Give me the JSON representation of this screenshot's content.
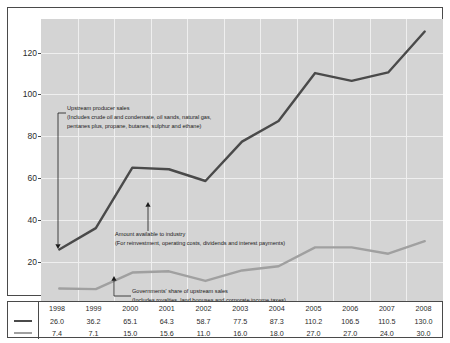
{
  "chart_data": {
    "type": "line",
    "title": "",
    "xlabel": "",
    "ylabel": "",
    "ylim": [
      0,
      136
    ],
    "yticks": [
      20,
      40,
      60,
      80,
      100,
      120
    ],
    "grid": true,
    "legend_position": "table-left",
    "categories": [
      "1998",
      "1999",
      "2000",
      "2001",
      "2002",
      "2003",
      "2004",
      "2005",
      "2006",
      "2007",
      "2008"
    ],
    "series": [
      {
        "name": "Upstream producer sales",
        "color": "#4a4a4a",
        "values": [
          26.0,
          36.2,
          65.1,
          64.3,
          58.7,
          77.5,
          87.3,
          110.2,
          106.5,
          110.5,
          130.0
        ]
      },
      {
        "name": "Governments' share of upstream sales",
        "color": "#a0a0a0",
        "values": [
          7.4,
          7.1,
          15.0,
          15.6,
          11.0,
          16.0,
          18.0,
          27.0,
          27.0,
          24.0,
          30.0
        ]
      }
    ],
    "annotations": [
      {
        "id": "upstream-producer-sales",
        "line1": "Upstream producer sales",
        "line2": "(Includes crude oil and condensate, oil sands, natural gas,",
        "line3": "pentanes plus, propane, butanes, sulphur and ethane)"
      },
      {
        "id": "amount-available-to-industry",
        "line1": "Amount available to industry",
        "line2": "(For reinvestment, operating costs, dividends and interest payments)",
        "line3": ""
      },
      {
        "id": "governments-share",
        "line1": "Governments' share of upstream sales",
        "line2": "(Includes royalties, land bonuses and corporate income taxes)",
        "line3": ""
      }
    ]
  },
  "table": {
    "headers": [
      "1998",
      "1999",
      "2000",
      "2001",
      "2002",
      "2003",
      "2004",
      "2005",
      "2006",
      "2007",
      "2008"
    ],
    "rows": [
      {
        "swatch": "dark-line-swatch",
        "values": [
          "26.0",
          "36.2",
          "65.1",
          "64.3",
          "58.7",
          "77.5",
          "87.3",
          "110.2",
          "106.5",
          "110.5",
          "130.0"
        ]
      },
      {
        "swatch": "light-line-swatch",
        "values": [
          "7.4",
          "7.1",
          "15.0",
          "15.6",
          "11.0",
          "16.0",
          "18.0",
          "27.0",
          "27.0",
          "24.0",
          "30.0"
        ]
      }
    ]
  }
}
